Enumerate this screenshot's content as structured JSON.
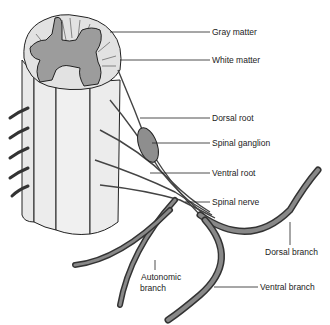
{
  "figure": {
    "labels": {
      "gray_matter": "Gray matter",
      "white_matter": "White matter",
      "dorsal_root": "Dorsal root",
      "spinal_ganglion": "Spinal ganglion",
      "ventral_root": "Ventral root",
      "spinal_nerve": "Spinal nerve",
      "dorsal_branch": "Dorsal branch",
      "autonomic_branch_1": "Autonomic",
      "autonomic_branch_2": "branch",
      "ventral_branch": "Ventral branch"
    },
    "colors": {
      "gray_matter": "#9a9a9a",
      "white_matter": "#e6e6e6",
      "outline": "#222222",
      "nerve": "#7a7a7a"
    }
  }
}
